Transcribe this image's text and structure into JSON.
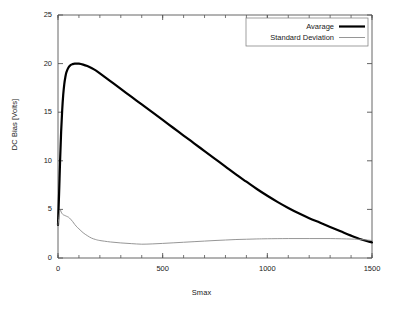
{
  "chart_data": {
    "type": "line",
    "title": "",
    "xlabel": "Smax",
    "ylabel": "DC Bias [Volts]",
    "xlim": [
      0,
      1500
    ],
    "ylim": [
      0,
      25
    ],
    "xticks": [
      0,
      500,
      1000,
      1500
    ],
    "yticks": [
      0,
      5,
      10,
      15,
      20,
      25
    ],
    "xtick_labels": [
      "0",
      "500",
      "1000",
      "1500"
    ],
    "ytick_labels": [
      "0",
      "5",
      "10",
      "15",
      "20",
      "25"
    ],
    "x_minor_tick_step": 100,
    "grid": false,
    "legend_position": "upper right",
    "legend_boxed": true,
    "series": [
      {
        "name": "Avarage",
        "color": "#000000",
        "linewidth": 2.2,
        "x": [
          0,
          5,
          10,
          15,
          20,
          25,
          30,
          35,
          40,
          50,
          60,
          70,
          80,
          90,
          100,
          120,
          140,
          160,
          180,
          200,
          250,
          300,
          350,
          400,
          450,
          500,
          550,
          600,
          650,
          700,
          750,
          800,
          850,
          900,
          950,
          1000,
          1050,
          1100,
          1150,
          1200,
          1250,
          1300,
          1350,
          1400,
          1450,
          1500
        ],
        "y": [
          3.4,
          6.5,
          10.0,
          13.0,
          15.2,
          16.8,
          17.9,
          18.6,
          19.1,
          19.6,
          19.85,
          19.95,
          20.0,
          20.0,
          20.0,
          19.9,
          19.75,
          19.55,
          19.3,
          19.0,
          18.2,
          17.4,
          16.6,
          15.8,
          15.0,
          14.2,
          13.4,
          12.6,
          11.8,
          11.0,
          10.2,
          9.4,
          8.6,
          7.85,
          7.1,
          6.4,
          5.75,
          5.15,
          4.6,
          4.1,
          3.65,
          3.2,
          2.75,
          2.3,
          1.9,
          1.6
        ]
      },
      {
        "name": "Standard Deviation",
        "color": "#8a8a8a",
        "linewidth": 0.9,
        "x": [
          0,
          5,
          10,
          15,
          20,
          25,
          30,
          40,
          50,
          60,
          70,
          80,
          90,
          100,
          120,
          140,
          160,
          180,
          200,
          250,
          300,
          350,
          400,
          450,
          500,
          550,
          600,
          650,
          700,
          750,
          800,
          850,
          900,
          950,
          1000,
          1100,
          1200,
          1300,
          1400,
          1450,
          1500
        ],
        "y": [
          3.4,
          4.3,
          4.95,
          4.75,
          4.55,
          4.45,
          4.4,
          4.3,
          4.2,
          4.0,
          3.75,
          3.45,
          3.2,
          3.0,
          2.6,
          2.3,
          2.05,
          1.9,
          1.8,
          1.65,
          1.55,
          1.48,
          1.42,
          1.45,
          1.5,
          1.56,
          1.62,
          1.68,
          1.74,
          1.8,
          1.85,
          1.9,
          1.93,
          1.96,
          1.98,
          2.0,
          2.0,
          2.0,
          1.95,
          1.9,
          1.8
        ]
      }
    ],
    "legend_entries": [
      {
        "label": "Avarage",
        "color": "#000000",
        "linewidth": 2.2
      },
      {
        "label": "Standard Deviation",
        "color": "#8a8a8a",
        "linewidth": 0.9
      }
    ]
  }
}
